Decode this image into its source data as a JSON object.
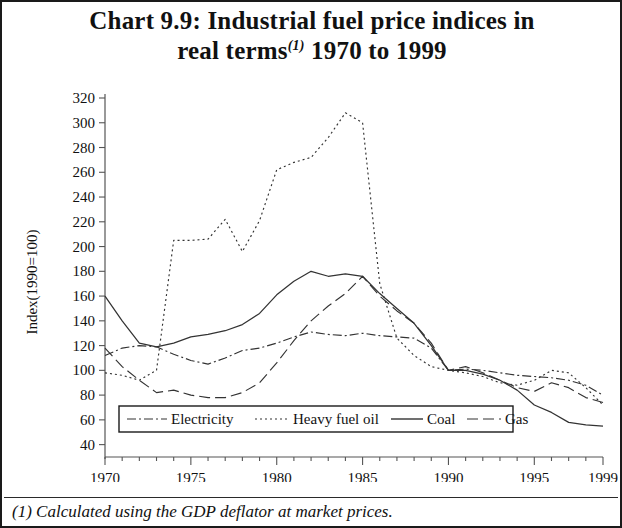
{
  "title": {
    "main_line1": "Chart 9.9: Industrial fuel price indices in",
    "main_line2_pre": "real terms",
    "superscript": "(1)",
    "main_line2_post": " 1970 to 1999"
  },
  "footnote": "(1) Calculated using the GDP deflator at market prices.",
  "axes": {
    "ylabel": "Index(1990=100)",
    "yticks": [
      40,
      60,
      80,
      100,
      120,
      140,
      160,
      180,
      200,
      220,
      240,
      260,
      280,
      300,
      320
    ],
    "ylim": [
      30,
      320
    ],
    "xticks": [
      1970,
      1975,
      1980,
      1985,
      1990,
      1995,
      1999
    ],
    "xlim": [
      1970,
      1999
    ],
    "xminor_step": 1,
    "grid": false
  },
  "legend": {
    "position": "bottom-inside",
    "entries": [
      {
        "label": "Electricity",
        "dash": "dashdot"
      },
      {
        "label": "Heavy fuel oil",
        "dash": "dotted"
      },
      {
        "label": "Coal",
        "dash": "solid"
      },
      {
        "label": "Gas",
        "dash": "dashed"
      }
    ]
  },
  "chart_data": {
    "type": "line",
    "title": "Chart 9.9: Industrial fuel price indices in real terms(1) 1970 to 1999",
    "xlabel": "",
    "ylabel": "Index(1990=100)",
    "xlim": [
      1970,
      1999
    ],
    "ylim": [
      30,
      320
    ],
    "x": [
      1970,
      1971,
      1972,
      1973,
      1974,
      1975,
      1976,
      1977,
      1978,
      1979,
      1980,
      1981,
      1982,
      1983,
      1984,
      1985,
      1986,
      1987,
      1988,
      1989,
      1990,
      1991,
      1992,
      1993,
      1994,
      1995,
      1996,
      1997,
      1998,
      1999
    ],
    "series": [
      {
        "name": "Electricity",
        "dash": "dashdot",
        "color": "#333333",
        "values": [
          112,
          118,
          120,
          119,
          113,
          108,
          105,
          110,
          116,
          118,
          122,
          127,
          131,
          129,
          128,
          130,
          128,
          127,
          126,
          118,
          100,
          101,
          100,
          98,
          96,
          95,
          94,
          92,
          88,
          80
        ]
      },
      {
        "name": "Heavy fuel oil",
        "dash": "dotted",
        "color": "#333333",
        "values": [
          98,
          96,
          92,
          100,
          205,
          205,
          206,
          222,
          196,
          221,
          262,
          268,
          272,
          288,
          308,
          300,
          170,
          126,
          112,
          103,
          100,
          98,
          95,
          90,
          88,
          92,
          100,
          98,
          86,
          72
        ]
      },
      {
        "name": "Coal",
        "dash": "solid",
        "color": "#333333",
        "values": [
          160,
          140,
          122,
          119,
          122,
          127,
          129,
          132,
          137,
          146,
          161,
          172,
          180,
          176,
          178,
          176,
          162,
          150,
          138,
          120,
          100,
          100,
          97,
          92,
          84,
          72,
          66,
          58,
          56,
          55
        ]
      },
      {
        "name": "Gas",
        "dash": "dashed",
        "color": "#333333",
        "values": [
          118,
          103,
          92,
          82,
          84,
          80,
          78,
          78,
          82,
          90,
          106,
          124,
          140,
          152,
          162,
          176,
          160,
          148,
          138,
          122,
          100,
          103,
          98,
          92,
          86,
          83,
          90,
          86,
          78,
          74
        ]
      }
    ]
  }
}
